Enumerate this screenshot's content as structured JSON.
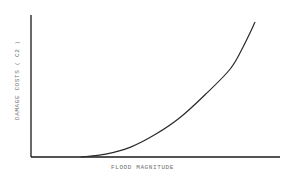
{
  "chart_data": {
    "type": "line",
    "title": "",
    "xlabel": "FLOOD MAGNITUDE",
    "ylabel": "DAMAGE COSTS ( C2 )",
    "grid": false,
    "legend": null,
    "ticks": "none",
    "series": [
      {
        "name": "Damage costs vs flood magnitude",
        "description": "Convex, monotonically increasing curve; zero damage until a threshold magnitude, then rising steeply",
        "x": [
          0.0,
          0.2,
          0.3,
          0.4,
          0.5,
          0.6,
          0.7,
          0.8,
          0.85,
          0.9
        ],
        "y": [
          0.0,
          0.0,
          0.02,
          0.07,
          0.16,
          0.28,
          0.44,
          0.62,
          0.77,
          0.95
        ]
      }
    ],
    "xlim": [
      0,
      1
    ],
    "ylim": [
      0,
      1
    ]
  },
  "colors": {
    "axis": "#1a1a1a",
    "curve": "#2a2a2a",
    "label": "#6e6e6e",
    "background": "#ffffff"
  }
}
